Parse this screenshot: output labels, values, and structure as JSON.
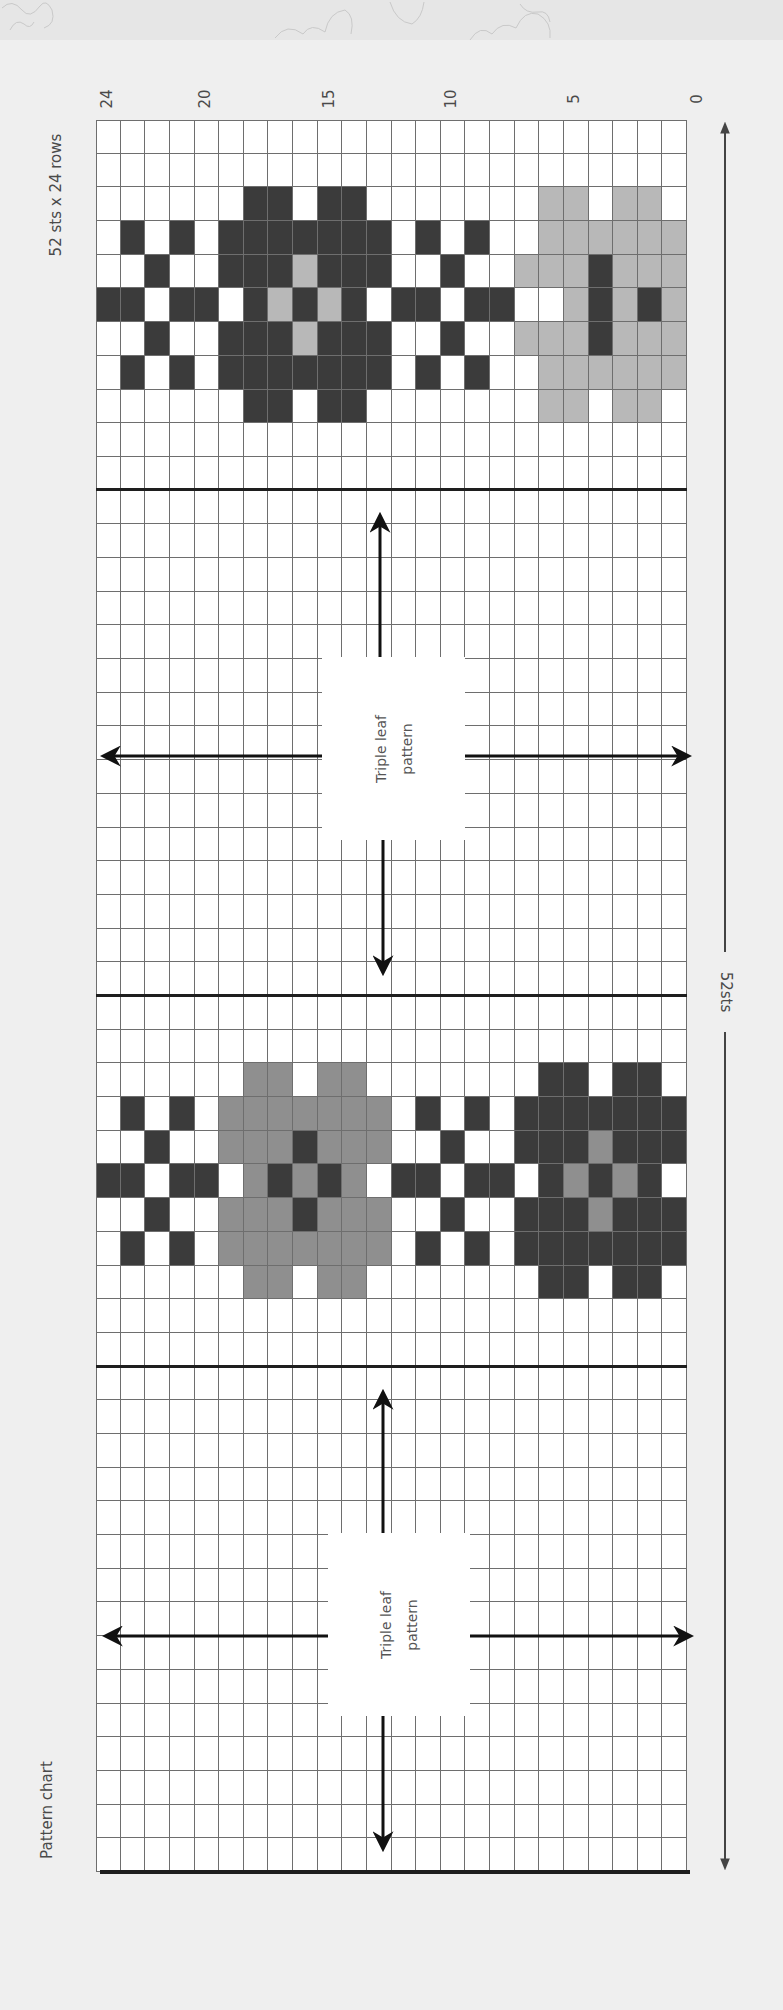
{
  "header": {
    "title": "Pattern chart",
    "size_label": "52 sts x 24 rows"
  },
  "row_axis": {
    "labels": [
      "24",
      "20",
      "15",
      "10",
      "5",
      "0"
    ]
  },
  "stitch_dimension": {
    "label": "52sts"
  },
  "sections": [
    {
      "label": "Triple leaf pattern",
      "line1": "Triple leaf",
      "line2": "pattern"
    },
    {
      "label": "Triple leaf pattern",
      "line1": "Triple leaf",
      "line2": "pattern"
    }
  ],
  "colors": {
    "background": "#efefef",
    "empty": "#ffffff",
    "dark": "#3b3b3b",
    "light_gray": "#b8b8b8",
    "mid_gray": "#8f8f8f",
    "grid_line": "#6e6e6e"
  },
  "chart_data": {
    "type": "heatmap",
    "title": "Pattern chart",
    "subtitle": "52 sts x 24 rows",
    "xlabel": "rows",
    "ylabel": "52sts",
    "row_ticks": [
      "24",
      "20",
      "15",
      "10",
      "5",
      "0"
    ],
    "legend": {
      "0": "white (background)",
      "1": "dark",
      "2": "light gray",
      "3": "mid gray"
    },
    "stitches": 52,
    "rows": 24,
    "orientation": "rotated 90deg: screen columns = rows (24 at left, 0 at right), screen rows = stitches",
    "grid": [
      "000000000000000000000000",
      "000000000000000000000000",
      "000000110110000000220220",
      "010101111111010100222222",
      "001001112111001002221222",
      "110110121210110110021212",
      "001001112111001002221222",
      "010101111111010100222222",
      "000000110110000000220220",
      "000000000000000000000000",
      "000000000000000000000000",
      "000000000000000000000000",
      "000000000000000000000000",
      "000000000000000000000000",
      "000000000000000000000000",
      "000000000000000000000000",
      "000000000000000000000000",
      "000000000000000000000000",
      "000000000000000000000000",
      "000000000000000000000000",
      "000000000000000000000000",
      "000000000000000000000000",
      "000000000000000000000000",
      "000000000000000000000000",
      "000000000000000000000000",
      "000000000000000000000000",
      "000000000000000000000000",
      "000000000000000000000000",
      "000000330330000000110110",
      "010103333333010101111111",
      "001003331333001001113111",
      "110110313130110110131310",
      "001003331333001001113111",
      "010103333333010101111111",
      "000000330330000000110110",
      "000000000000000000000000",
      "000000000000000000000000",
      "000000000000000000000000",
      "000000000000000000000000",
      "000000000000000000000000",
      "000000000000000000000000",
      "000000000000000000000000",
      "000000000000000000000000",
      "000000000000000000000000",
      "000000000000000000000000",
      "000000000000000000000000",
      "000000000000000000000000",
      "000000000000000000000000",
      "000000000000000000000000",
      "000000000000000000000000",
      "000000000000000000000000",
      "000000000000000000000000"
    ],
    "divider_after_rows": [
      10,
      25,
      36
    ],
    "section_boxes": [
      {
        "label": "Triple leaf pattern",
        "stitch_range": [
          11,
          25
        ]
      },
      {
        "label": "Triple leaf pattern",
        "stitch_range": [
          37,
          51
        ]
      }
    ]
  }
}
